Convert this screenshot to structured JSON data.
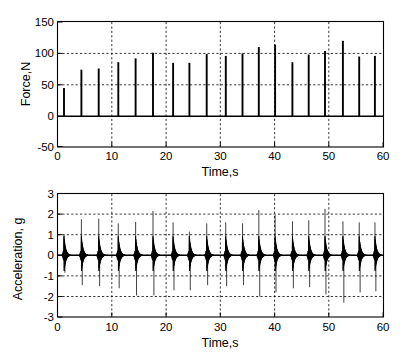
{
  "figure": {
    "background": "#ffffff",
    "line_color": "#000000",
    "panels": [
      "force-time-plot",
      "acceleration-time-plot"
    ]
  },
  "chart_data": [
    {
      "type": "bar",
      "id": "force-time-plot",
      "title": "",
      "xlabel": "Time,s",
      "ylabel": "Force,N",
      "xlim": [
        0,
        60
      ],
      "ylim": [
        -50,
        150
      ],
      "xticks": [
        0,
        10,
        20,
        30,
        40,
        50,
        60
      ],
      "yticks": [
        -50,
        0,
        50,
        100,
        150
      ],
      "xticklabels": [
        "0",
        "10",
        "20",
        "30",
        "40",
        "50",
        "60"
      ],
      "yticklabels": [
        "-50",
        "0",
        "50",
        "100",
        "150"
      ],
      "grid": true,
      "legend": "none",
      "x": [
        1.2,
        4.4,
        7.6,
        11.2,
        14.4,
        17.6,
        21.3,
        24.3,
        27.5,
        31.0,
        34.1,
        37.1,
        40.1,
        43.3,
        46.3,
        49.3,
        52.6,
        55.6,
        58.5
      ],
      "values": [
        45,
        74,
        76,
        86,
        92,
        101,
        85,
        85,
        99,
        96,
        100,
        110,
        114,
        86,
        98,
        104,
        120,
        95,
        96
      ],
      "baseline": 0
    },
    {
      "type": "line",
      "id": "acceleration-time-plot",
      "title": "",
      "xlabel": "Time,s",
      "ylabel": "Acceleration, g",
      "xlim": [
        0,
        60
      ],
      "ylim": [
        -3,
        3
      ],
      "xticks": [
        0,
        10,
        20,
        30,
        40,
        50,
        60
      ],
      "yticks": [
        -3,
        -2,
        -1,
        0,
        1,
        2,
        3
      ],
      "xticklabels": [
        "0",
        "10",
        "20",
        "30",
        "40",
        "50",
        "60"
      ],
      "yticklabels": [
        "-3",
        "-2",
        "-1",
        "0",
        "1",
        "2",
        "3"
      ],
      "grid": true,
      "legend": "none",
      "x": [
        1.2,
        4.4,
        7.6,
        11.2,
        14.4,
        17.6,
        21.3,
        24.3,
        27.5,
        31.0,
        34.1,
        37.1,
        40.1,
        43.3,
        46.3,
        49.3,
        52.6,
        55.6,
        58.5
      ],
      "peak_positive": [
        1.0,
        1.75,
        1.78,
        1.55,
        1.62,
        2.15,
        1.6,
        1.15,
        1.55,
        1.6,
        1.55,
        2.2,
        1.95,
        1.65,
        1.7,
        2.25,
        1.65,
        1.6,
        1.6
      ],
      "peak_negative": [
        -0.85,
        -1.45,
        -1.5,
        -1.6,
        -1.95,
        -1.95,
        -1.7,
        -1.7,
        -1.45,
        -1.5,
        -1.45,
        -2.0,
        -1.8,
        -1.6,
        -1.55,
        -1.9,
        -2.3,
        -1.8,
        -1.75
      ],
      "envelope_note": "each impulse is a damped oscillation burst decaying to zero"
    }
  ]
}
